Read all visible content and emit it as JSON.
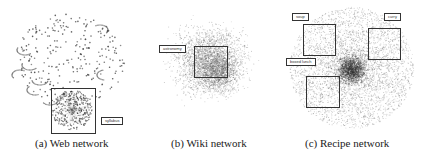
{
  "figure": {
    "panels": [
      {
        "id": "a",
        "caption": "(a) Web network",
        "labels": [
          "syllabus"
        ]
      },
      {
        "id": "b",
        "caption": "(b) Wiki network",
        "labels": [
          "astronomy"
        ]
      },
      {
        "id": "c",
        "caption": "(c) Recipe network",
        "labels": [
          "soup",
          "curry",
          "boxed lunch"
        ]
      }
    ]
  }
}
